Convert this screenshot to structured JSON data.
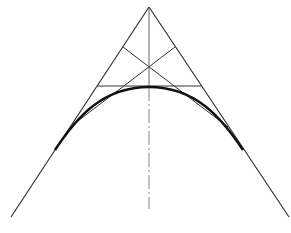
{
  "diagram": {
    "title": "",
    "colors": {
      "background": "#ffffff",
      "line": "#333333",
      "curve": "#111111",
      "axis": "#777777"
    },
    "apex": [
      149,
      7
    ],
    "left_side": {
      "from": [
        149,
        7
      ],
      "to": [
        11,
        217
      ]
    },
    "right_side": {
      "from": [
        149,
        7
      ],
      "to": [
        289,
        217
      ]
    },
    "horizontal_tangent": {
      "from": [
        97,
        86
      ],
      "to": [
        201,
        86
      ]
    },
    "diagonal_a": {
      "from": [
        123,
        47
      ],
      "to": [
        228,
        127
      ]
    },
    "diagonal_b": {
      "from": [
        175,
        47
      ],
      "to": [
        70,
        127
      ]
    },
    "diagonals_crossing": [
      149,
      66
    ],
    "axis_solid": {
      "from": [
        149,
        7
      ],
      "to": [
        149,
        87
      ]
    },
    "axis_dashed": {
      "from": [
        149,
        87
      ],
      "to": [
        149,
        209
      ]
    },
    "curve": {
      "start": [
        55,
        150
      ],
      "vertex": [
        149,
        87
      ],
      "end": [
        243,
        150
      ]
    }
  }
}
